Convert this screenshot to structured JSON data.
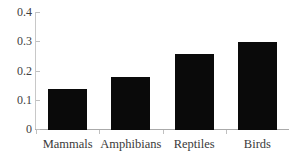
{
  "chart_data": {
    "type": "bar",
    "title": "",
    "subtitle": "",
    "xlabel": "",
    "ylabel": "",
    "categories": [
      "Mammals",
      "Amphibians",
      "Reptiles",
      "Birds"
    ],
    "values": [
      0.14,
      0.18,
      0.26,
      0.3
    ],
    "ylim": [
      0,
      0.4
    ],
    "ytick_labels": [
      "0",
      "0.1",
      "0.2",
      "0.3",
      "0.4"
    ],
    "ytick_values": [
      0,
      0.1,
      0.2,
      0.3,
      0.4
    ],
    "grid": false,
    "legend": false,
    "legend_position": "none",
    "bar_color": "#0a0a0a",
    "background_color": "#ffffff",
    "axis_color": "#c0c0c0",
    "annotations": []
  }
}
